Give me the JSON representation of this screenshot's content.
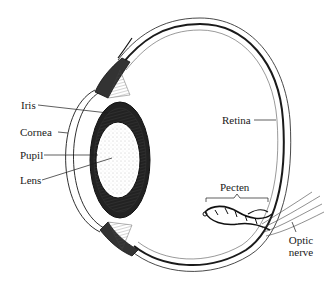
{
  "diagram": {
    "labels": {
      "iris": "Iris",
      "cornea": "Cornea",
      "pupil": "Pupil",
      "lens": "Lens",
      "retina": "Retina",
      "pecten": "Pecten",
      "optic_nerve_line1": "Optic",
      "optic_nerve_line2": "nerve"
    },
    "colors": {
      "ink": "#1a1a1a",
      "background": "#ffffff",
      "stipple": "#9a9a9a"
    }
  }
}
